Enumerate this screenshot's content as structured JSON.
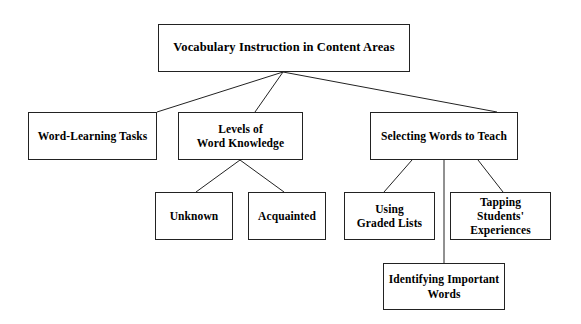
{
  "diagram": {
    "title": "Vocabulary Instruction in Content Areas",
    "type": "hierarchical-tree",
    "background_color": "#ffffff",
    "line_color": "#222222",
    "text_color": "#000000",
    "nodes": {
      "root": {
        "label": "Vocabulary Instruction in Content Areas",
        "level": 1
      },
      "word_learning_tasks": {
        "label": "Word-Learning Tasks",
        "level": 2
      },
      "levels_of_word_knowledge": {
        "label": "Levels of\nWord Knowledge",
        "level": 2
      },
      "selecting_words_to_teach": {
        "label": "Selecting Words to Teach",
        "level": 2
      },
      "unknown": {
        "label": "Unknown",
        "level": 3
      },
      "acquainted": {
        "label": "Acquainted",
        "level": 3
      },
      "using_graded_lists": {
        "label": "Using\nGraded Lists",
        "level": 3
      },
      "tapping_students_experiences": {
        "label": "Tapping Students'\nExperiences",
        "level": 3
      },
      "identifying_important_words": {
        "label": "Identifying Important\nWords",
        "level": 3
      }
    },
    "edges": [
      {
        "from": "root",
        "to": "word_learning_tasks"
      },
      {
        "from": "root",
        "to": "levels_of_word_knowledge"
      },
      {
        "from": "root",
        "to": "selecting_words_to_teach"
      },
      {
        "from": "levels_of_word_knowledge",
        "to": "unknown"
      },
      {
        "from": "levels_of_word_knowledge",
        "to": "acquainted"
      },
      {
        "from": "selecting_words_to_teach",
        "to": "using_graded_lists"
      },
      {
        "from": "selecting_words_to_teach",
        "to": "identifying_important_words"
      },
      {
        "from": "selecting_words_to_teach",
        "to": "tapping_students_experiences"
      }
    ]
  }
}
